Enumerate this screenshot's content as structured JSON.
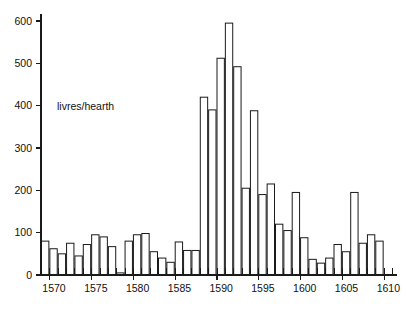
{
  "chart_data": {
    "type": "bar",
    "title": "",
    "subtitle": "",
    "xlabel": "",
    "ylabel": "",
    "annotation": "livres/hearth",
    "grid": false,
    "legend": null,
    "ylim": [
      0,
      620
    ],
    "xlim": [
      1569,
      1611
    ],
    "yticks": [
      0,
      100,
      200,
      300,
      400,
      500,
      600
    ],
    "ytick_labels": [
      "0",
      "100",
      "200",
      "300",
      "400",
      "500",
      "600"
    ],
    "xticks": [
      1570,
      1575,
      1580,
      1585,
      1590,
      1595,
      1600,
      1605,
      1610
    ],
    "xtick_labels": [
      "1570",
      "1575",
      "1580",
      "1585",
      "1590",
      "1595",
      "1600",
      "1605",
      "1610"
    ],
    "bar_style": {
      "fill": "#ffffff",
      "edge": "#1a1a1a",
      "edge_width": 1
    },
    "categories": [
      1569,
      1570,
      1571,
      1572,
      1573,
      1574,
      1575,
      1576,
      1577,
      1578,
      1579,
      1580,
      1581,
      1582,
      1583,
      1584,
      1585,
      1586,
      1587,
      1588,
      1589,
      1590,
      1591,
      1592,
      1593,
      1594,
      1595,
      1596,
      1597,
      1598,
      1599,
      1600,
      1601,
      1602,
      1603,
      1604,
      1605,
      1606,
      1607,
      1608,
      1609,
      1610
    ],
    "values": [
      80,
      62,
      50,
      75,
      45,
      72,
      95,
      90,
      67,
      5,
      80,
      95,
      98,
      55,
      40,
      30,
      78,
      58,
      58,
      420,
      390,
      512,
      595,
      492,
      205,
      388,
      190,
      215,
      120,
      105,
      195,
      88,
      37,
      28,
      40,
      72,
      55,
      195,
      75,
      95,
      80,
      0
    ]
  },
  "chart_meta": {
    "plot_left": 41,
    "plot_right": 392,
    "plot_bottom": 275,
    "plot_top": 14,
    "y_zero": 275,
    "y_600": 21
  }
}
